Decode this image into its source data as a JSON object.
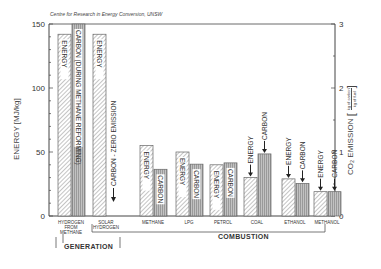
{
  "source_note": "Centre for Research in Energy Conversion, UNSW",
  "left_axis_label": "ENERGY [MJ/kg]",
  "right_axis_label": "CO₂ EMISSION",
  "right_axis_unit_num": "kg of carbon",
  "right_axis_unit_den": "kg of fuel",
  "groups": [
    {
      "label": "GENERATION"
    },
    {
      "label": "COMBUSTION"
    }
  ],
  "colors": {
    "energy_fill": "#ffffff",
    "energy_hatch": "#8a8a8a",
    "carbon_fill": "#b5b5b5",
    "carbon_stripe": "#9a9a9a",
    "axis": "#444444"
  },
  "chart_data": {
    "type": "bar",
    "title": "",
    "source": "Centre for Research in Energy Conversion, UNSW",
    "categories": [
      "HYDROGEN FROM METHANE",
      "SOLAR HYDROGEN",
      "METHANE",
      "LPG",
      "PETROL",
      "COAL",
      "ETHANOL",
      "METHANOL"
    ],
    "series": [
      {
        "name": "ENERGY",
        "axis": "left",
        "unit": "MJ/kg",
        "values": [
          142,
          142,
          55,
          50,
          40,
          30,
          29,
          19
        ]
      },
      {
        "name": "CARBON",
        "axis": "right",
        "unit": "kg of carbon / kg of fuel",
        "values": [
          3.0,
          0,
          0.73,
          0.81,
          0.83,
          0.97,
          0.51,
          0.38
        ]
      }
    ],
    "bar_annotations": [
      {
        "category": "HYDROGEN FROM METHANE",
        "series": "ENERGY",
        "text": "ENERGY"
      },
      {
        "category": "HYDROGEN FROM METHANE",
        "series": "CARBON",
        "text": "CARBON (DURING METHANE REFORMING)"
      },
      {
        "category": "SOLAR HYDROGEN",
        "series": "ENERGY",
        "text": "ENERGY"
      },
      {
        "category": "SOLAR HYDROGEN",
        "series": "CARBON",
        "text": "CARBON - ZERO EMISSION"
      },
      {
        "category": "METHANE",
        "series": "ENERGY",
        "text": "ENERGY"
      },
      {
        "category": "METHANE",
        "series": "CARBON",
        "text": "CARBON"
      },
      {
        "category": "LPG",
        "series": "ENERGY",
        "text": "ENERGY"
      },
      {
        "category": "LPG",
        "series": "CARBON",
        "text": "CARBON"
      },
      {
        "category": "PETROL",
        "series": "ENERGY",
        "text": "ENERGY"
      },
      {
        "category": "PETROL",
        "series": "CARBON",
        "text": "CARBON"
      },
      {
        "category": "COAL",
        "series": "ENERGY",
        "text": "ENERGY"
      },
      {
        "category": "COAL",
        "series": "CARBON",
        "text": "CARBON"
      },
      {
        "category": "ETHANOL",
        "series": "ENERGY",
        "text": "ENERGY"
      },
      {
        "category": "ETHANOL",
        "series": "CARBON",
        "text": "CARBON"
      },
      {
        "category": "METHANOL",
        "series": "ENERGY",
        "text": "ENERGY"
      },
      {
        "category": "METHANOL",
        "series": "CARBON",
        "text": "CARBON"
      }
    ],
    "category_groups": [
      {
        "label": "GENERATION",
        "categories": [
          "HYDROGEN FROM METHANE"
        ]
      },
      {
        "label": "COMBUSTION",
        "categories": [
          "SOLAR HYDROGEN",
          "METHANE",
          "LPG",
          "PETROL",
          "COAL",
          "ETHANOL",
          "METHANOL"
        ]
      }
    ],
    "xlabel": "",
    "ylabel": "ENERGY [MJ/kg]",
    "ylabel_right": "CO2 EMISSION [kg of carbon / kg of fuel]",
    "ylim": [
      0,
      150
    ],
    "ylim_right": [
      0,
      3
    ],
    "yticks": [
      0,
      50,
      100,
      150
    ],
    "yticks_right": [
      0,
      1,
      2,
      3
    ],
    "grid": false,
    "legend": "none (bars labeled inline)"
  }
}
